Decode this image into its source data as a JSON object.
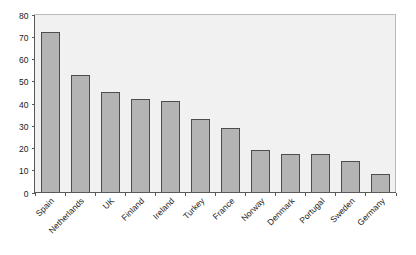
{
  "chart_data": {
    "type": "bar",
    "title": "",
    "subtitle": "",
    "xlabel": "",
    "ylabel": "",
    "ylim": [
      0,
      80
    ],
    "y_ticks": [
      0,
      10,
      20,
      30,
      40,
      50,
      60,
      70,
      80
    ],
    "grid": false,
    "legend": false,
    "legend_position": "none",
    "orientation": "vertical",
    "categories": [
      "Spain",
      "Netherlands",
      "UK",
      "Finland",
      "Ireland",
      "Turkey",
      "France",
      "Norway",
      "Denmark",
      "Portugal",
      "Sweden",
      "Germany"
    ],
    "values": [
      72,
      53,
      45,
      42,
      41,
      33,
      29,
      19,
      17.5,
      17.5,
      14,
      8.5
    ],
    "series": [
      {
        "name": "",
        "values": [
          72,
          53,
          45,
          42,
          41,
          33,
          29,
          19,
          17.5,
          17.5,
          14,
          8.5
        ]
      }
    ],
    "colors": {
      "bar_fill": "#b4b4b4",
      "bar_stroke": "#4d4d4d",
      "plot_background": "#f1f1f1",
      "plot_border": "#bbbbbb",
      "axis": "#595959",
      "text": "#1a1a1a",
      "page_background": "#ffffff"
    },
    "label_rotation_degrees": 45
  }
}
